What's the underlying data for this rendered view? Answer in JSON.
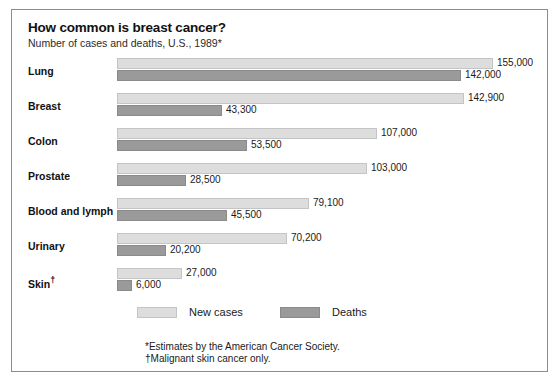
{
  "chart_data": {
    "type": "bar",
    "orientation": "horizontal",
    "title": "How common is breast cancer?",
    "subtitle": "Number of cases and deaths, U.S., 1989*",
    "xlabel": "",
    "ylabel": "",
    "grid": false,
    "legend_position": "bottom",
    "xlim": [
      0,
      155000
    ],
    "categories": [
      "Lung",
      "Breast",
      "Colon",
      "Prostate",
      "Blood and lymph",
      "Urinary",
      "Skin†"
    ],
    "series": [
      {
        "name": "New cases",
        "color": "#dddddd",
        "values": [
          155000,
          142900,
          107000,
          103000,
          79100,
          70200,
          27000
        ],
        "labels": [
          "155,000",
          "142,900",
          "107,000",
          "103,000",
          "79,100",
          "70,200",
          "27,000"
        ]
      },
      {
        "name": "Deaths",
        "color": "#9a9a9a",
        "values": [
          142000,
          43300,
          53500,
          28500,
          45500,
          20200,
          6000
        ],
        "labels": [
          "142,000",
          "43,300",
          "53,500",
          "28,500",
          "45,500",
          "20,200",
          "6,000"
        ]
      }
    ],
    "annotations": [
      "*Estimates by the American Cancer Society.",
      "†Malignant skin cancer only."
    ]
  },
  "legend": {
    "cases_label": "New cases",
    "deaths_label": "Deaths"
  },
  "footnotes": {
    "line1": "*Estimates by the American Cancer Society.",
    "line2": "†Malignant skin cancer only."
  }
}
